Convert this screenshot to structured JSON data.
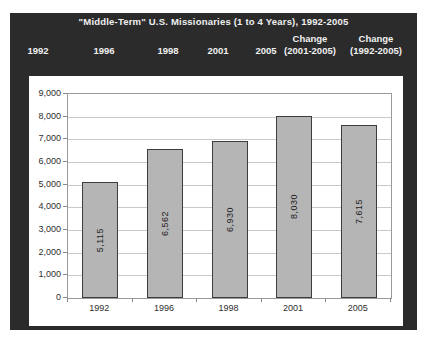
{
  "window": {
    "page_background": "#ffffff",
    "frame_color": "#2b2b2b",
    "header_text_color": "#f0f0f0"
  },
  "header": {
    "title": "\"Middle-Term\" U.S. Missionaries (1 to 4 Years), 1992-2005",
    "columns": [
      {
        "line1": "",
        "line2": "1992"
      },
      {
        "line1": "",
        "line2": "1996"
      },
      {
        "line1": "",
        "line2": "1998"
      },
      {
        "line1": "",
        "line2": "2001"
      },
      {
        "line1": "",
        "line2": "2005"
      },
      {
        "line1": "Change",
        "line2": "(2001-2005)"
      },
      {
        "line1": "Change",
        "line2": "(1992-2005)"
      }
    ]
  },
  "chart_data": {
    "type": "bar",
    "title": "\"Middle-Term\" U.S. Missionaries (1 to 4 Years), 1992-2005",
    "categories": [
      "1992",
      "1996",
      "1998",
      "2001",
      "2005"
    ],
    "values": [
      5115,
      6562,
      6930,
      8030,
      7615
    ],
    "bar_labels": [
      "5,115",
      "6,562",
      "6,930",
      "8,030",
      "7,615"
    ],
    "xlabel": "",
    "ylabel": "",
    "ylim": [
      0,
      9000
    ],
    "ytick_step": 1000,
    "ytick_labels": [
      "0",
      "1,000",
      "2,000",
      "3,000",
      "4,000",
      "5,000",
      "6,000",
      "7,000",
      "8,000",
      "9,000"
    ],
    "grid": true,
    "legend": "none",
    "bar_label_orientation": "vertical",
    "bar_color": "#b5b5b5",
    "bar_border_color": "#3c3c3c",
    "plot_background": "#ffffff",
    "gridline_color": "#c9c9c9"
  }
}
